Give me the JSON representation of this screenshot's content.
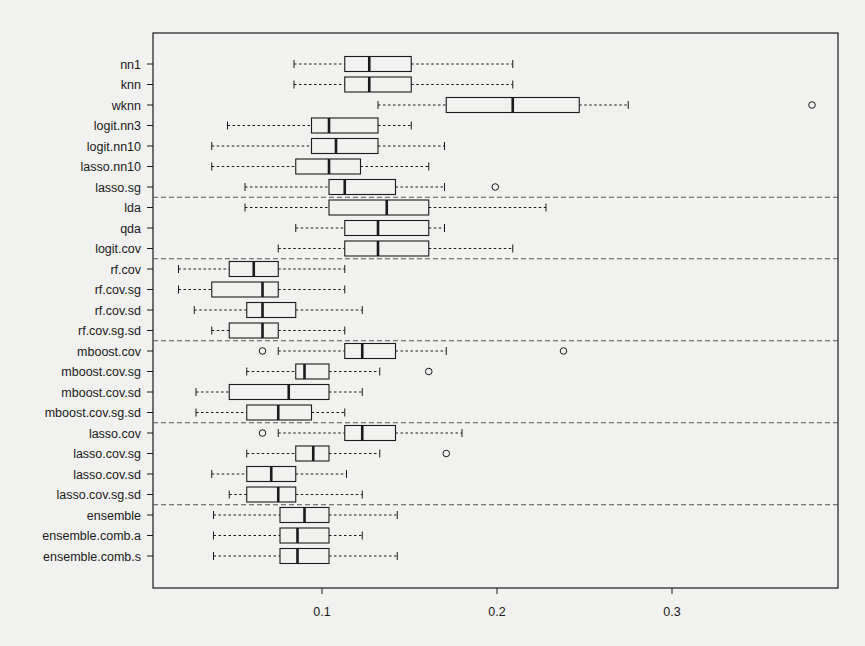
{
  "chart_data": {
    "type": "boxplot",
    "orientation": "horizontal",
    "title": "",
    "xlabel": "",
    "ylabel": "",
    "xlim": [
      0.0,
      0.393
    ],
    "x_ticks": [
      0.1,
      0.2,
      0.3
    ],
    "x_tick_labels": [
      "0.1",
      "0.2",
      "0.3"
    ],
    "grid": false,
    "group_separators_after": [
      "lasso.sg",
      "logit.cov",
      "rf.cov.sg.sd",
      "mboost.cov.sg.sd",
      "lasso.cov.sg.sd"
    ],
    "series": [
      {
        "name": "nn1",
        "whisker_low": 0.084,
        "q1": 0.113,
        "median": 0.127,
        "q3": 0.151,
        "whisker_high": 0.209,
        "outliers": []
      },
      {
        "name": "knn",
        "whisker_low": 0.084,
        "q1": 0.113,
        "median": 0.127,
        "q3": 0.151,
        "whisker_high": 0.209,
        "outliers": []
      },
      {
        "name": "wknn",
        "whisker_low": 0.132,
        "q1": 0.171,
        "median": 0.209,
        "q3": 0.247,
        "whisker_high": 0.275,
        "outliers": [
          0.38
        ]
      },
      {
        "name": "logit.nn3",
        "whisker_low": 0.046,
        "q1": 0.094,
        "median": 0.104,
        "q3": 0.132,
        "whisker_high": 0.151,
        "outliers": []
      },
      {
        "name": "logit.nn10",
        "whisker_low": 0.037,
        "q1": 0.094,
        "median": 0.108,
        "q3": 0.132,
        "whisker_high": 0.17,
        "outliers": []
      },
      {
        "name": "lasso.nn10",
        "whisker_low": 0.037,
        "q1": 0.085,
        "median": 0.104,
        "q3": 0.122,
        "whisker_high": 0.161,
        "outliers": []
      },
      {
        "name": "lasso.sg",
        "whisker_low": 0.056,
        "q1": 0.104,
        "median": 0.113,
        "q3": 0.142,
        "whisker_high": 0.17,
        "outliers": [
          0.199
        ]
      },
      {
        "name": "lda",
        "whisker_low": 0.056,
        "q1": 0.104,
        "median": 0.137,
        "q3": 0.161,
        "whisker_high": 0.228,
        "outliers": []
      },
      {
        "name": "qda",
        "whisker_low": 0.085,
        "q1": 0.113,
        "median": 0.132,
        "q3": 0.161,
        "whisker_high": 0.17,
        "outliers": []
      },
      {
        "name": "logit.cov",
        "whisker_low": 0.075,
        "q1": 0.113,
        "median": 0.132,
        "q3": 0.161,
        "whisker_high": 0.209,
        "outliers": []
      },
      {
        "name": "rf.cov",
        "whisker_low": 0.018,
        "q1": 0.047,
        "median": 0.061,
        "q3": 0.075,
        "whisker_high": 0.113,
        "outliers": []
      },
      {
        "name": "rf.cov.sg",
        "whisker_low": 0.018,
        "q1": 0.037,
        "median": 0.066,
        "q3": 0.075,
        "whisker_high": 0.113,
        "outliers": []
      },
      {
        "name": "rf.cov.sd",
        "whisker_low": 0.027,
        "q1": 0.057,
        "median": 0.066,
        "q3": 0.085,
        "whisker_high": 0.123,
        "outliers": []
      },
      {
        "name": "rf.cov.sg.sd",
        "whisker_low": 0.037,
        "q1": 0.047,
        "median": 0.066,
        "q3": 0.075,
        "whisker_high": 0.113,
        "outliers": []
      },
      {
        "name": "mboost.cov",
        "whisker_low": 0.075,
        "q1": 0.113,
        "median": 0.123,
        "q3": 0.142,
        "whisker_high": 0.171,
        "outliers": [
          0.066,
          0.238
        ]
      },
      {
        "name": "mboost.cov.sg",
        "whisker_low": 0.057,
        "q1": 0.085,
        "median": 0.09,
        "q3": 0.104,
        "whisker_high": 0.133,
        "outliers": [
          0.161
        ]
      },
      {
        "name": "mboost.cov.sd",
        "whisker_low": 0.028,
        "q1": 0.047,
        "median": 0.081,
        "q3": 0.104,
        "whisker_high": 0.123,
        "outliers": []
      },
      {
        "name": "mboost.cov.sg.sd",
        "whisker_low": 0.028,
        "q1": 0.057,
        "median": 0.075,
        "q3": 0.094,
        "whisker_high": 0.113,
        "outliers": []
      },
      {
        "name": "lasso.cov",
        "whisker_low": 0.075,
        "q1": 0.113,
        "median": 0.123,
        "q3": 0.142,
        "whisker_high": 0.18,
        "outliers": [
          0.066
        ]
      },
      {
        "name": "lasso.cov.sg",
        "whisker_low": 0.057,
        "q1": 0.085,
        "median": 0.095,
        "q3": 0.104,
        "whisker_high": 0.133,
        "outliers": [
          0.171
        ]
      },
      {
        "name": "lasso.cov.sd",
        "whisker_low": 0.037,
        "q1": 0.057,
        "median": 0.071,
        "q3": 0.085,
        "whisker_high": 0.114,
        "outliers": []
      },
      {
        "name": "lasso.cov.sg.sd",
        "whisker_low": 0.047,
        "q1": 0.057,
        "median": 0.075,
        "q3": 0.085,
        "whisker_high": 0.123,
        "outliers": []
      },
      {
        "name": "ensemble",
        "whisker_low": 0.038,
        "q1": 0.076,
        "median": 0.09,
        "q3": 0.104,
        "whisker_high": 0.143,
        "outliers": []
      },
      {
        "name": "ensemble.comb.a",
        "whisker_low": 0.038,
        "q1": 0.076,
        "median": 0.086,
        "q3": 0.104,
        "whisker_high": 0.123,
        "outliers": []
      },
      {
        "name": "ensemble.comb.s",
        "whisker_low": 0.038,
        "q1": 0.076,
        "median": 0.086,
        "q3": 0.104,
        "whisker_high": 0.143,
        "outliers": []
      }
    ]
  },
  "colors": {
    "background": "#f1f1ef",
    "ink": "#1a1a1a",
    "separator": "#555555"
  }
}
